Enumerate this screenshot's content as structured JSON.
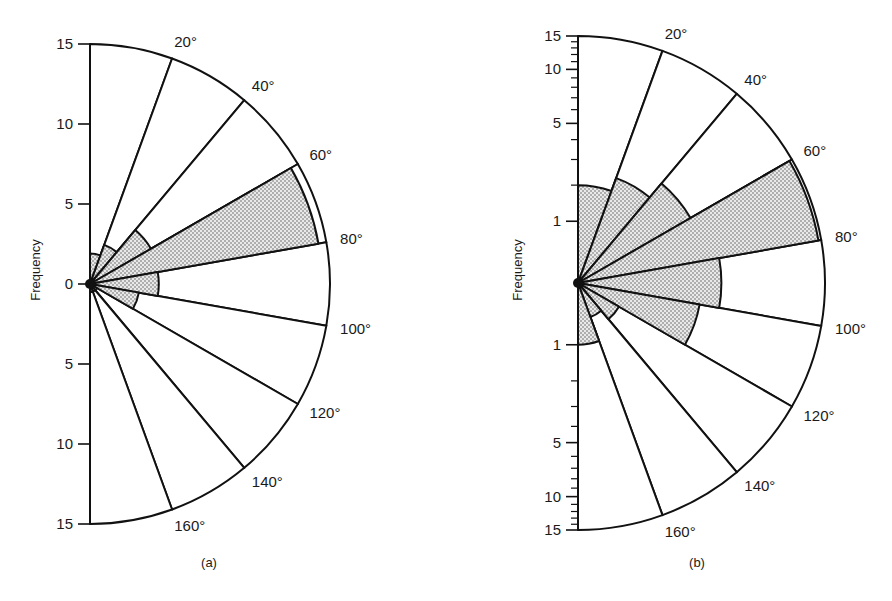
{
  "figure": {
    "panels": [
      {
        "id": "a",
        "label": "(a)",
        "ylabel": "Frequency",
        "scale": "linear"
      },
      {
        "id": "b",
        "label": "(b)",
        "ylabel": "Frequency",
        "scale": "log"
      }
    ]
  },
  "chart_data": [
    {
      "type": "rose",
      "title": "",
      "panel_label": "(a)",
      "ylabel": "Frequency",
      "radial_scale": "linear",
      "ylim": [
        0,
        15
      ],
      "radial_ticks": [
        0,
        5,
        10,
        15
      ],
      "radial_tick_labels_upper": [
        "0",
        "5",
        "10",
        "15"
      ],
      "radial_tick_labels_lower": [
        "5",
        "10",
        "15"
      ],
      "angle_bins_deg": [
        0,
        20,
        40,
        60,
        80,
        100,
        120,
        140,
        160,
        180
      ],
      "angle_labels": [
        "20°",
        "40°",
        "60°",
        "80°",
        "100°",
        "120°",
        "140°",
        "160°"
      ],
      "series": [
        {
          "name": "total (white sectors)",
          "values": [
            15,
            15,
            15,
            15,
            15,
            15,
            15,
            15,
            15
          ]
        },
        {
          "name": "stippled",
          "values": [
            1.9,
            2.6,
            4.4,
            14.5,
            4.3,
            3.1,
            0.5,
            0.5,
            0.5
          ]
        }
      ],
      "grid": false,
      "legend": "none"
    },
    {
      "type": "rose",
      "title": "",
      "panel_label": "(b)",
      "ylabel": "Frequency",
      "radial_scale": "log",
      "ylim": [
        0,
        15
      ],
      "radial_ticks": [
        1,
        5,
        10,
        15
      ],
      "radial_tick_labels_upper": [
        "1",
        "5",
        "10",
        "15"
      ],
      "radial_tick_labels_lower": [
        "1",
        "5",
        "10",
        "15"
      ],
      "angle_bins_deg": [
        0,
        20,
        40,
        60,
        80,
        100,
        120,
        140,
        160,
        180
      ],
      "angle_labels": [
        "20°",
        "40°",
        "60°",
        "80°",
        "100°",
        "120°",
        "140°",
        "160°"
      ],
      "series": [
        {
          "name": "total (white sectors)",
          "values": [
            15,
            15,
            15,
            15,
            15,
            15,
            15,
            15,
            15
          ]
        },
        {
          "name": "stippled",
          "values": [
            2,
            2.5,
            3.3,
            14.5,
            4,
            3,
            0.7,
            0.5,
            1
          ]
        }
      ],
      "grid": false,
      "legend": "none"
    }
  ]
}
